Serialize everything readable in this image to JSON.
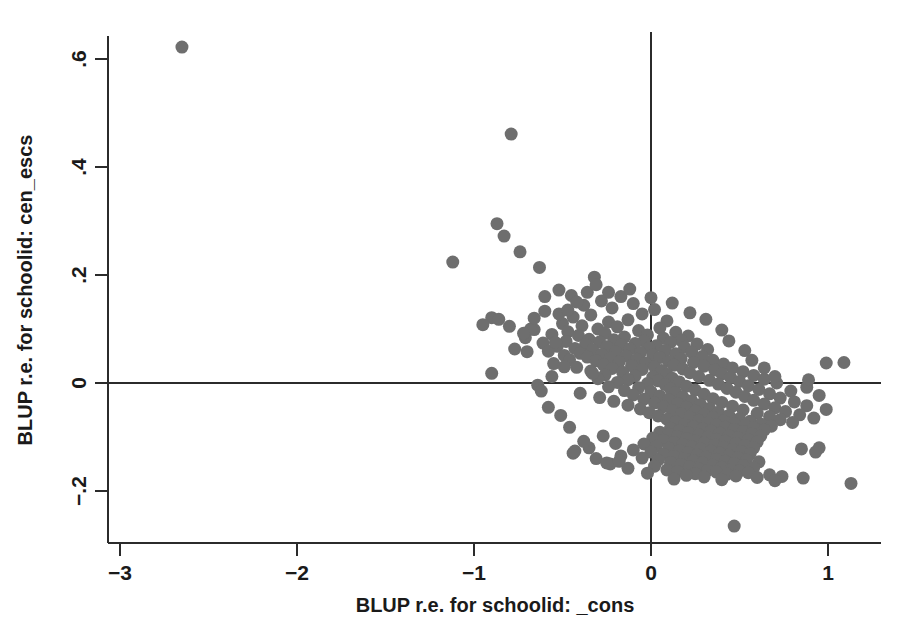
{
  "chart_data": {
    "type": "scatter",
    "title": "",
    "xlabel": "BLUP r.e. for schoolid: _cons",
    "ylabel": "BLUP r.e. for schoolid: cen_escs",
    "xlim": [
      -3.25,
      1.3
    ],
    "ylim": [
      -0.29,
      0.66
    ],
    "xticks": [
      -3,
      -2,
      -1,
      0,
      1
    ],
    "xtick_labels": [
      "-3",
      "-2",
      "-1",
      "0",
      "1"
    ],
    "yticks": [
      -0.2,
      0,
      0.2,
      0.4,
      0.6
    ],
    "ytick_labels": [
      "-.2",
      "0",
      ".2",
      ".4",
      ".6"
    ],
    "grid": false,
    "legend": null,
    "marker_color": "#6e6e6e",
    "marker_size_px": 13,
    "reference_lines": [
      {
        "orientation": "horizontal",
        "value": 0
      },
      {
        "orientation": "vertical",
        "value": 0
      }
    ],
    "n_points": 318,
    "points": [
      [
        -2.65,
        0.622
      ],
      [
        -0.79,
        0.461
      ],
      [
        -0.87,
        0.295
      ],
      [
        -0.83,
        0.272
      ],
      [
        -0.74,
        0.243
      ],
      [
        -1.12,
        0.224
      ],
      [
        -0.63,
        0.214
      ],
      [
        -0.32,
        0.196
      ],
      [
        -0.52,
        0.172
      ],
      [
        -0.45,
        0.162
      ],
      [
        -0.17,
        0.16
      ],
      [
        -0.28,
        0.152
      ],
      [
        -0.1,
        0.147
      ],
      [
        -0.38,
        0.144
      ],
      [
        -0.22,
        0.139
      ],
      [
        0.02,
        0.136
      ],
      [
        -0.6,
        0.133
      ],
      [
        -0.05,
        0.128
      ],
      [
        -0.34,
        0.126
      ],
      [
        -0.44,
        0.122
      ],
      [
        -0.9,
        0.121
      ],
      [
        -0.86,
        0.118
      ],
      [
        -0.13,
        0.117
      ],
      [
        0.09,
        0.115
      ],
      [
        -0.24,
        0.113
      ],
      [
        -0.5,
        0.11
      ],
      [
        -0.95,
        0.108
      ],
      [
        -0.39,
        0.106
      ],
      [
        -0.19,
        0.104
      ],
      [
        0.05,
        0.102
      ],
      [
        -0.3,
        0.1
      ],
      [
        -0.66,
        0.099
      ],
      [
        -0.07,
        0.097
      ],
      [
        -0.47,
        0.095
      ],
      [
        0.14,
        0.094
      ],
      [
        -0.26,
        0.092
      ],
      [
        -0.56,
        0.09
      ],
      [
        -0.02,
        0.089
      ],
      [
        -0.41,
        0.088
      ],
      [
        0.21,
        0.087
      ],
      [
        -0.15,
        0.085
      ],
      [
        -0.71,
        0.084
      ],
      [
        0.07,
        0.083
      ],
      [
        -0.35,
        0.081
      ],
      [
        -0.21,
        0.08
      ],
      [
        0.17,
        0.079
      ],
      [
        -0.04,
        0.078
      ],
      [
        -0.48,
        0.077
      ],
      [
        -0.29,
        0.076
      ],
      [
        0.11,
        0.075
      ],
      [
        -0.61,
        0.074
      ],
      [
        -0.09,
        0.073
      ],
      [
        0.26,
        0.072
      ],
      [
        -0.37,
        0.071
      ],
      [
        -0.17,
        0.07
      ],
      [
        0.03,
        0.069
      ],
      [
        -0.53,
        0.068
      ],
      [
        -0.25,
        0.067
      ],
      [
        0.19,
        0.066
      ],
      [
        -0.01,
        0.065
      ],
      [
        -0.43,
        0.064
      ],
      [
        -0.12,
        0.063
      ],
      [
        0.32,
        0.062
      ],
      [
        -0.33,
        0.061
      ],
      [
        0.08,
        0.06
      ],
      [
        -0.58,
        0.059
      ],
      [
        -0.2,
        0.058
      ],
      [
        0.23,
        0.057
      ],
      [
        -0.06,
        0.056
      ],
      [
        -0.4,
        0.055
      ],
      [
        0.14,
        0.054
      ],
      [
        -0.28,
        0.053
      ],
      [
        0.01,
        0.052
      ],
      [
        -0.49,
        0.051
      ],
      [
        -0.14,
        0.05
      ],
      [
        0.29,
        0.049
      ],
      [
        -0.36,
        0.048
      ],
      [
        0.05,
        0.047
      ],
      [
        -0.23,
        0.046
      ],
      [
        0.17,
        0.045
      ],
      [
        -0.08,
        0.044
      ],
      [
        -0.46,
        0.043
      ],
      [
        0.35,
        0.042
      ],
      [
        -0.31,
        0.041
      ],
      [
        0.1,
        0.04
      ],
      [
        -0.18,
        0.039
      ],
      [
        0.24,
        0.038
      ],
      [
        -0.03,
        0.037
      ],
      [
        -0.55,
        0.036
      ],
      [
        0.41,
        0.035
      ],
      [
        -0.27,
        0.034
      ],
      [
        0.13,
        0.033
      ],
      [
        -0.11,
        0.032
      ],
      [
        0.3,
        0.031
      ],
      [
        0.02,
        0.03
      ],
      [
        -0.42,
        0.029
      ],
      [
        0.46,
        0.028
      ],
      [
        -0.22,
        0.027
      ],
      [
        0.18,
        0.026
      ],
      [
        -0.05,
        0.025
      ],
      [
        0.36,
        0.024
      ],
      [
        0.06,
        0.023
      ],
      [
        -0.34,
        0.022
      ],
      [
        0.52,
        0.021
      ],
      [
        -0.16,
        0.02
      ],
      [
        0.22,
        0.019
      ],
      [
        -0.9,
        0.018
      ],
      [
        0.4,
        0.017
      ],
      [
        0.09,
        0.016
      ],
      [
        -0.26,
        0.015
      ],
      [
        0.58,
        0.014
      ],
      [
        -0.09,
        0.013
      ],
      [
        0.27,
        0.012
      ],
      [
        0.01,
        0.011
      ],
      [
        0.45,
        0.01
      ],
      [
        0.12,
        0.009
      ],
      [
        -0.3,
        0.008
      ],
      [
        0.64,
        0.007
      ],
      [
        -0.13,
        0.006
      ],
      [
        0.33,
        0.005
      ],
      [
        0.04,
        0.004
      ],
      [
        0.5,
        0.003
      ],
      [
        0.16,
        0.002
      ],
      [
        -0.19,
        0.001
      ],
      [
        0.71,
        0.0
      ],
      [
        -0.02,
        -0.001
      ],
      [
        0.38,
        -0.002
      ],
      [
        0.08,
        -0.003
      ],
      [
        -0.64,
        -0.004
      ],
      [
        0.55,
        -0.005
      ],
      [
        0.2,
        -0.006
      ],
      [
        -0.24,
        -0.007
      ],
      [
        0.88,
        -0.008
      ],
      [
        -0.07,
        -0.009
      ],
      [
        0.43,
        -0.01
      ],
      [
        0.11,
        -0.011
      ],
      [
        0.61,
        -0.012
      ],
      [
        0.25,
        -0.013
      ],
      [
        -0.15,
        -0.014
      ],
      [
        0.79,
        -0.015
      ],
      [
        0.0,
        -0.016
      ],
      [
        0.48,
        -0.017
      ],
      [
        0.14,
        -0.018
      ],
      [
        -0.4,
        -0.019
      ],
      [
        0.67,
        -0.02
      ],
      [
        0.3,
        -0.021
      ],
      [
        -0.1,
        -0.022
      ],
      [
        0.95,
        -0.023
      ],
      [
        0.05,
        -0.024
      ],
      [
        0.53,
        -0.025
      ],
      [
        0.18,
        -0.026
      ],
      [
        -0.29,
        -0.027
      ],
      [
        0.73,
        -0.028
      ],
      [
        0.35,
        -0.029
      ],
      [
        -0.04,
        -0.03
      ],
      [
        1.09,
        0.038
      ],
      [
        0.1,
        -0.031
      ],
      [
        0.58,
        -0.032
      ],
      [
        0.23,
        -0.033
      ],
      [
        -0.21,
        -0.034
      ],
      [
        0.81,
        -0.035
      ],
      [
        0.4,
        -0.036
      ],
      [
        0.02,
        -0.037
      ],
      [
        0.15,
        -0.038
      ],
      [
        0.64,
        -0.039
      ],
      [
        0.28,
        -0.04
      ],
      [
        -0.13,
        -0.041
      ],
      [
        0.88,
        -0.042
      ],
      [
        0.46,
        -0.043
      ],
      [
        0.07,
        -0.044
      ],
      [
        0.2,
        -0.045
      ],
      [
        0.7,
        -0.046
      ],
      [
        0.33,
        -0.047
      ],
      [
        -0.06,
        -0.048
      ],
      [
        0.99,
        -0.049
      ],
      [
        0.52,
        -0.05
      ],
      [
        0.12,
        -0.051
      ],
      [
        0.25,
        -0.052
      ],
      [
        0.76,
        -0.053
      ],
      [
        0.38,
        -0.054
      ],
      [
        -0.01,
        -0.055
      ],
      [
        0.6,
        -0.056
      ],
      [
        0.17,
        -0.057
      ],
      [
        0.3,
        -0.058
      ],
      [
        0.84,
        -0.059
      ],
      [
        0.44,
        -0.06
      ],
      [
        0.04,
        -0.061
      ],
      [
        0.67,
        -0.062
      ],
      [
        0.22,
        -0.063
      ],
      [
        0.35,
        -0.064
      ],
      [
        0.92,
        -0.065
      ],
      [
        0.5,
        -0.066
      ],
      [
        0.09,
        -0.067
      ],
      [
        0.73,
        -0.068
      ],
      [
        0.27,
        -0.069
      ],
      [
        0.41,
        -0.07
      ],
      [
        0.56,
        -0.071
      ],
      [
        0.14,
        -0.072
      ],
      [
        0.8,
        -0.073
      ],
      [
        0.32,
        -0.074
      ],
      [
        0.47,
        -0.075
      ],
      [
        0.62,
        -0.076
      ],
      [
        0.19,
        -0.077
      ],
      [
        0.37,
        -0.078
      ],
      [
        0.53,
        -0.079
      ],
      [
        0.68,
        -0.08
      ],
      [
        0.24,
        -0.081
      ],
      [
        0.42,
        -0.082
      ],
      [
        0.58,
        -0.083
      ],
      [
        0.11,
        -0.084
      ],
      [
        0.29,
        -0.085
      ],
      [
        0.47,
        -0.086
      ],
      [
        0.64,
        -0.087
      ],
      [
        0.16,
        -0.088
      ],
      [
        0.34,
        -0.089
      ],
      [
        0.52,
        -0.09
      ],
      [
        0.05,
        -0.091
      ],
      [
        0.21,
        -0.092
      ],
      [
        0.39,
        -0.093
      ],
      [
        0.57,
        -0.094
      ],
      [
        0.1,
        -0.095
      ],
      [
        0.27,
        -0.096
      ],
      [
        0.44,
        -0.097
      ],
      [
        0.62,
        -0.098
      ],
      [
        0.15,
        -0.099
      ],
      [
        0.32,
        -0.1
      ],
      [
        0.49,
        -0.101
      ],
      [
        0.01,
        -0.102
      ],
      [
        0.2,
        -0.103
      ],
      [
        0.37,
        -0.104
      ],
      [
        0.55,
        -0.105
      ],
      [
        0.07,
        -0.106
      ],
      [
        0.25,
        -0.107
      ],
      [
        0.42,
        -0.108
      ],
      [
        0.6,
        -0.109
      ],
      [
        0.13,
        -0.11
      ],
      [
        0.3,
        -0.111
      ],
      [
        0.48,
        -0.112
      ],
      [
        -0.04,
        -0.113
      ],
      [
        0.18,
        -0.114
      ],
      [
        0.36,
        -0.115
      ],
      [
        0.53,
        -0.116
      ],
      [
        0.03,
        -0.117
      ],
      [
        0.23,
        -0.118
      ],
      [
        0.41,
        -0.119
      ],
      [
        0.58,
        -0.12
      ],
      [
        0.1,
        -0.121
      ],
      [
        0.28,
        -0.122
      ],
      [
        0.46,
        -0.123
      ],
      [
        -0.1,
        -0.124
      ],
      [
        0.16,
        -0.125
      ],
      [
        0.34,
        -0.126
      ],
      [
        0.51,
        -0.127
      ],
      [
        0.0,
        -0.128
      ],
      [
        0.21,
        -0.129
      ],
      [
        0.39,
        -0.13
      ],
      [
        0.56,
        -0.131
      ],
      [
        0.07,
        -0.132
      ],
      [
        0.26,
        -0.133
      ],
      [
        0.44,
        -0.134
      ],
      [
        -0.17,
        -0.135
      ],
      [
        0.13,
        -0.136
      ],
      [
        0.31,
        -0.137
      ],
      [
        0.49,
        -0.138
      ],
      [
        -0.05,
        -0.139
      ],
      [
        0.19,
        -0.14
      ],
      [
        0.37,
        -0.141
      ],
      [
        0.54,
        -0.142
      ],
      [
        0.04,
        -0.143
      ],
      [
        0.24,
        -0.144
      ],
      [
        0.42,
        -0.145
      ],
      [
        0.61,
        -0.146
      ],
      [
        0.11,
        -0.147
      ],
      [
        0.29,
        -0.148
      ],
      [
        0.47,
        -0.149
      ],
      [
        -0.23,
        -0.15
      ],
      [
        0.17,
        -0.151
      ],
      [
        0.35,
        -0.152
      ],
      [
        0.52,
        -0.153
      ],
      [
        0.02,
        -0.154
      ],
      [
        0.22,
        -0.155
      ],
      [
        0.4,
        -0.156
      ],
      [
        0.58,
        -0.157
      ],
      [
        -0.13,
        -0.158
      ],
      [
        0.27,
        -0.159
      ],
      [
        0.45,
        -0.16
      ],
      [
        0.09,
        -0.161
      ],
      [
        0.32,
        -0.162
      ],
      [
        0.5,
        -0.163
      ],
      [
        -0.35,
        -0.12
      ],
      [
        0.15,
        -0.164
      ],
      [
        0.37,
        -0.165
      ],
      [
        0.55,
        -0.166
      ],
      [
        -0.02,
        -0.167
      ],
      [
        0.25,
        -0.168
      ],
      [
        0.43,
        -0.169
      ],
      [
        0.67,
        -0.17
      ],
      [
        0.2,
        -0.171
      ],
      [
        0.48,
        -0.172
      ],
      [
        0.74,
        -0.173
      ],
      [
        0.3,
        -0.174
      ],
      [
        0.6,
        -0.175
      ],
      [
        0.86,
        -0.176
      ],
      [
        -0.44,
        -0.13
      ],
      [
        0.13,
        -0.178
      ],
      [
        0.4,
        -0.179
      ],
      [
        0.7,
        -0.181
      ],
      [
        1.13,
        -0.186
      ],
      [
        0.95,
        -0.12
      ],
      [
        0.93,
        -0.128
      ],
      [
        0.85,
        -0.122
      ],
      [
        0.89,
        0.006
      ],
      [
        0.99,
        0.037
      ],
      [
        0.47,
        -0.265
      ],
      [
        -0.56,
        0.012
      ],
      [
        -0.8,
        0.105
      ],
      [
        -0.68,
        0.1
      ],
      [
        -0.72,
        0.092
      ],
      [
        -0.77,
        0.063
      ],
      [
        -0.7,
        0.058
      ],
      [
        -0.62,
        -0.015
      ],
      [
        -0.58,
        -0.045
      ],
      [
        -0.51,
        -0.06
      ],
      [
        -0.46,
        -0.082
      ],
      [
        -0.38,
        -0.108
      ],
      [
        -0.43,
        -0.126
      ],
      [
        -0.31,
        -0.14
      ],
      [
        -0.25,
        -0.148
      ],
      [
        -0.18,
        -0.145
      ],
      [
        -0.33,
        0.018
      ],
      [
        -0.27,
        -0.098
      ],
      [
        -0.2,
        -0.112
      ],
      [
        -0.49,
        0.03
      ],
      [
        -0.54,
        0.075
      ],
      [
        -0.66,
        0.12
      ],
      [
        -0.6,
        0.16
      ],
      [
        -0.52,
        0.128
      ],
      [
        -0.47,
        0.135
      ],
      [
        -0.42,
        0.15
      ],
      [
        -0.36,
        0.168
      ],
      [
        -0.31,
        0.182
      ],
      [
        -0.24,
        0.168
      ],
      [
        -0.12,
        0.174
      ],
      [
        0.0,
        0.158
      ],
      [
        0.12,
        0.148
      ],
      [
        0.22,
        0.13
      ],
      [
        0.31,
        0.118
      ],
      [
        0.4,
        0.098
      ],
      [
        0.44,
        0.078
      ],
      [
        0.53,
        0.06
      ],
      [
        0.57,
        0.042
      ],
      [
        0.64,
        0.028
      ],
      [
        0.7,
        0.012
      ]
    ]
  }
}
